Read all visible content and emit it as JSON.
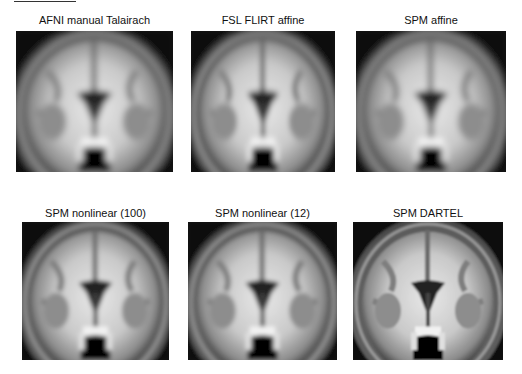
{
  "figure": {
    "panels": [
      {
        "title": "AFNI manual Talairach",
        "variant": "blurry"
      },
      {
        "title": "FSL FLIRT affine",
        "variant": "blurry"
      },
      {
        "title": "SPM affine",
        "variant": "blurry"
      },
      {
        "title": "SPM nonlinear (100)",
        "variant": "medium"
      },
      {
        "title": "SPM nonlinear (12)",
        "variant": "medium"
      },
      {
        "title": "SPM DARTEL",
        "variant": "sharp"
      }
    ]
  }
}
